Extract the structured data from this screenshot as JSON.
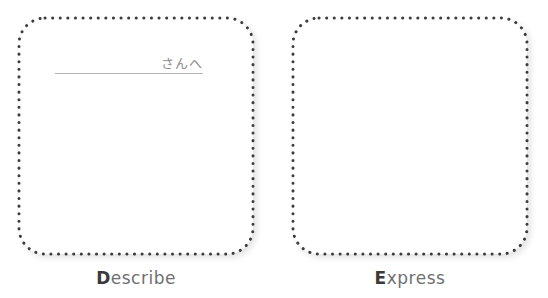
{
  "cards": [
    {
      "id": "describe",
      "addressee_suffix": "さんへ",
      "caption_initial": "D",
      "caption_rest": "escribe"
    },
    {
      "id": "express",
      "caption_initial": "E",
      "caption_rest": "xpress"
    }
  ],
  "style": {
    "dot_color": "#3c3c3c",
    "caption_color": "#6f6f6f"
  }
}
